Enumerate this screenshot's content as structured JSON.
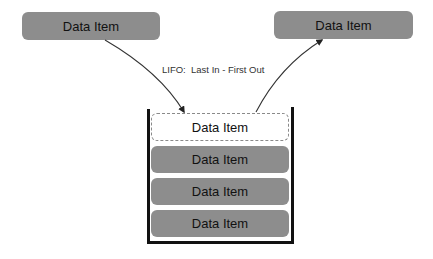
{
  "diagram": {
    "title_label": "LIFO:  Last In - First Out",
    "incoming_item": {
      "label": "Data Item"
    },
    "outgoing_item": {
      "label": "Data Item"
    },
    "stack": {
      "top_slot": {
        "label": "Data Item",
        "style": "dashed"
      },
      "items": [
        {
          "label": "Data Item"
        },
        {
          "label": "Data Item"
        },
        {
          "label": "Data Item"
        }
      ]
    },
    "arrows": [
      {
        "name": "push-arrow",
        "from": "incoming_item",
        "to": "stack.top_slot"
      },
      {
        "name": "pop-arrow",
        "from": "stack.top_slot",
        "to": "outgoing_item"
      }
    ],
    "colors": {
      "item_fill": "#8d8d8d",
      "container_stroke": "#111111",
      "dashed_border": "#8a8a8a",
      "text": "#111111"
    }
  }
}
